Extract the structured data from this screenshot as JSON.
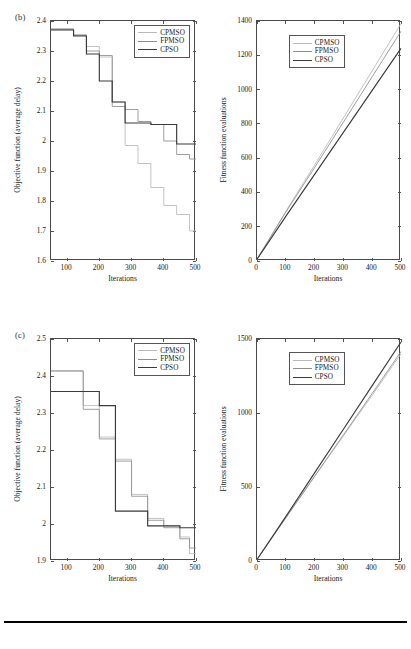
{
  "figure": {
    "panels": [
      {
        "tag": "(b)",
        "charts": [
          {
            "name": "objective-function-chart-b",
            "chart_data": {
              "type": "line",
              "title": "",
              "xlabel": "Iterations",
              "ylabel": "Objective function (average delay)",
              "xlim": [
                50,
                500
              ],
              "ylim": [
                1.6,
                2.4
              ],
              "xticks": [
                100,
                200,
                300,
                400,
                500
              ],
              "yticks": [
                "1.6",
                "1.7",
                "1.8",
                "1.9",
                "2",
                "2.1",
                "2.2",
                "2.3",
                "2.4"
              ],
              "grid": false,
              "legend_position": "top-right",
              "step": "post",
              "series": [
                {
                  "name": "CPMSO",
                  "color": "#b9b9b9",
                  "x": [
                    50,
                    120,
                    160,
                    200,
                    240,
                    280,
                    320,
                    360,
                    400,
                    440,
                    480,
                    500
                  ],
                  "values": [
                    2.375,
                    2.355,
                    2.315,
                    2.28,
                    2.13,
                    1.985,
                    1.925,
                    1.845,
                    1.785,
                    1.755,
                    1.7,
                    1.7
                  ]
                },
                {
                  "name": "FPMSO",
                  "color": "#8e8e8e",
                  "x": [
                    50,
                    120,
                    160,
                    200,
                    240,
                    280,
                    320,
                    360,
                    400,
                    440,
                    480,
                    500
                  ],
                  "values": [
                    2.372,
                    2.352,
                    2.3,
                    2.285,
                    2.115,
                    2.105,
                    2.065,
                    2.055,
                    2.0,
                    1.955,
                    1.94,
                    1.94
                  ]
                },
                {
                  "name": "CPSO",
                  "color": "#3a3a3a",
                  "x": [
                    50,
                    120,
                    160,
                    200,
                    240,
                    280,
                    320,
                    360,
                    400,
                    440,
                    480,
                    500
                  ],
                  "values": [
                    2.37,
                    2.35,
                    2.29,
                    2.2,
                    2.13,
                    2.06,
                    2.06,
                    2.055,
                    2.055,
                    1.99,
                    1.99,
                    1.99
                  ]
                }
              ]
            }
          },
          {
            "name": "fitness-evaluations-chart-b",
            "chart_data": {
              "type": "line",
              "title": "",
              "xlabel": "Iterations",
              "ylabel": "Fitness function evaluations",
              "xlim": [
                0,
                500
              ],
              "ylim": [
                0,
                1400
              ],
              "xticks": [
                0,
                100,
                200,
                300,
                400,
                500
              ],
              "yticks": [
                0,
                200,
                400,
                600,
                800,
                1000,
                1200,
                1400
              ],
              "grid": false,
              "legend_position": "top-left-inner",
              "series": [
                {
                  "name": "CPMSO",
                  "color": "#b9b9b9",
                  "x": [
                    0,
                    100,
                    200,
                    300,
                    400,
                    500
                  ],
                  "values": [
                    10,
                    290,
                    560,
                    835,
                    1110,
                    1385
                  ]
                },
                {
                  "name": "FPMSO",
                  "color": "#8e8e8e",
                  "x": [
                    0,
                    100,
                    200,
                    300,
                    400,
                    500
                  ],
                  "values": [
                    10,
                    285,
                    545,
                    810,
                    1075,
                    1340
                  ]
                },
                {
                  "name": "CPSO",
                  "color": "#3a3a3a",
                  "x": [
                    0,
                    100,
                    200,
                    300,
                    400,
                    500
                  ],
                  "values": [
                    10,
                    260,
                    505,
                    750,
                    995,
                    1240
                  ]
                }
              ]
            }
          }
        ]
      },
      {
        "tag": "(c)",
        "charts": [
          {
            "name": "objective-function-chart-c",
            "chart_data": {
              "type": "line",
              "title": "",
              "xlabel": "Iterations",
              "ylabel": "Objective function (average delay)",
              "xlim": [
                50,
                500
              ],
              "ylim": [
                1.9,
                2.5
              ],
              "xticks": [
                100,
                200,
                300,
                400,
                500
              ],
              "yticks": [
                "1.9",
                "2",
                "2.1",
                "2.2",
                "2.3",
                "2.4",
                "2.5"
              ],
              "grid": false,
              "legend_position": "top-right",
              "step": "post",
              "series": [
                {
                  "name": "CPMSO",
                  "color": "#b9b9b9",
                  "x": [
                    50,
                    150,
                    200,
                    250,
                    300,
                    350,
                    400,
                    450,
                    480,
                    500
                  ],
                  "values": [
                    2.415,
                    2.32,
                    2.235,
                    2.175,
                    2.08,
                    2.015,
                    1.995,
                    1.965,
                    1.92,
                    1.92
                  ]
                },
                {
                  "name": "FPMSO",
                  "color": "#8e8e8e",
                  "x": [
                    50,
                    150,
                    200,
                    250,
                    300,
                    350,
                    400,
                    450,
                    480,
                    500
                  ],
                  "values": [
                    2.413,
                    2.31,
                    2.23,
                    2.17,
                    2.075,
                    2.01,
                    1.99,
                    1.96,
                    1.935,
                    1.935
                  ]
                },
                {
                  "name": "CPSO",
                  "color": "#3a3a3a",
                  "x": [
                    50,
                    150,
                    200,
                    250,
                    300,
                    350,
                    400,
                    450,
                    480,
                    500
                  ],
                  "values": [
                    2.358,
                    2.358,
                    2.32,
                    2.035,
                    2.035,
                    1.995,
                    1.995,
                    1.99,
                    1.99,
                    1.99
                  ]
                }
              ]
            }
          },
          {
            "name": "fitness-evaluations-chart-c",
            "chart_data": {
              "type": "line",
              "title": "",
              "xlabel": "Iterations",
              "ylabel": "Fitness function evaluations",
              "xlim": [
                0,
                500
              ],
              "ylim": [
                0,
                1500
              ],
              "xticks": [
                0,
                100,
                200,
                300,
                400,
                500
              ],
              "yticks": [
                0,
                500,
                1000,
                1500
              ],
              "grid": false,
              "legend_position": "top-left-inner",
              "series": [
                {
                  "name": "CPMSO",
                  "color": "#b9b9b9",
                  "x": [
                    0,
                    100,
                    200,
                    300,
                    400,
                    500
                  ],
                  "values": [
                    10,
                    290,
                    570,
                    845,
                    1120,
                    1400
                  ]
                },
                {
                  "name": "FPMSO",
                  "color": "#8e8e8e",
                  "x": [
                    0,
                    100,
                    200,
                    300,
                    400,
                    500
                  ],
                  "values": [
                    10,
                    292,
                    573,
                    852,
                    1132,
                    1415
                  ]
                },
                {
                  "name": "CPSO",
                  "color": "#3a3a3a",
                  "x": [
                    0,
                    100,
                    200,
                    300,
                    400,
                    500
                  ],
                  "values": [
                    10,
                    300,
                    595,
                    890,
                    1185,
                    1480
                  ]
                }
              ]
            }
          }
        ]
      }
    ],
    "legend_labels": [
      "CPMSO",
      "FPMSO",
      "CPSO"
    ],
    "bottom_rule": true
  }
}
